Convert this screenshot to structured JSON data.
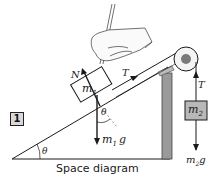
{
  "figure": {
    "number_badge": "1",
    "caption": "Space diagram"
  },
  "labels": {
    "normal_force": "N",
    "tension_incline": "T",
    "mass1": "m",
    "mass1_sub": "1",
    "angle_block": "θ",
    "weight1": "m",
    "weight1_sub": "1",
    "weight1_g": "g",
    "angle_incline": "θ",
    "tension_hanging": "T",
    "mass2": "m",
    "mass2_sub": "2",
    "weight2": "m",
    "weight2_sub": "2",
    "weight2_g": "g"
  },
  "colors": {
    "ink": "#1a1a1a",
    "post_fill": "#9a9a9a",
    "mass2_fill": "#b8b8b8",
    "pulley_center": "#7a7a7a",
    "badge_fill": "#d8d8d8"
  }
}
